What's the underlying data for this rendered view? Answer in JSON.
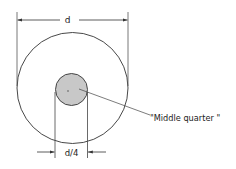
{
  "diagram": {
    "type": "cross-section dimension drawing",
    "outer_circle": {
      "label": "d",
      "fill": "#ffffff",
      "stroke": "#333333"
    },
    "inner_circle": {
      "label": "d/4",
      "fill": "#c8c8c8",
      "stroke": "#333333"
    },
    "callout": {
      "text": "\"Middle quarter\""
    }
  },
  "labels": {
    "outer_dimension": "d",
    "inner_dimension": "d/4",
    "callout": "\"Middle quarter \""
  }
}
